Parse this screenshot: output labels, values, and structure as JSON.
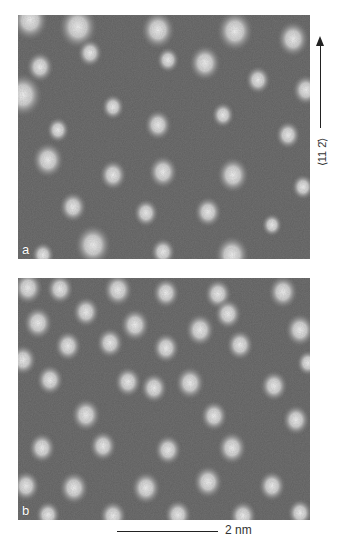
{
  "figure": {
    "panels": [
      {
        "label": "a",
        "description": "HRTEM lattice image with bright atomic columns on dark background",
        "bright_spots": [
          [
            12,
            5,
            16
          ],
          [
            60,
            12,
            17
          ],
          [
            140,
            15,
            15
          ],
          [
            217,
            16,
            16
          ],
          [
            275,
            24,
            14
          ],
          [
            5,
            80,
            17
          ],
          [
            22,
            52,
            12
          ],
          [
            72,
            38,
            11
          ],
          [
            150,
            45,
            10
          ],
          [
            187,
            48,
            14
          ],
          [
            288,
            75,
            12
          ],
          [
            95,
            92,
            10
          ],
          [
            240,
            65,
            11
          ],
          [
            40,
            115,
            10
          ],
          [
            140,
            110,
            12
          ],
          [
            205,
            100,
            10
          ],
          [
            270,
            120,
            11
          ],
          [
            30,
            145,
            14
          ],
          [
            95,
            160,
            12
          ],
          [
            145,
            157,
            13
          ],
          [
            215,
            160,
            14
          ],
          [
            285,
            172,
            10
          ],
          [
            55,
            192,
            12
          ],
          [
            128,
            198,
            11
          ],
          [
            190,
            197,
            12
          ],
          [
            254,
            210,
            9
          ],
          [
            75,
            230,
            16
          ],
          [
            25,
            240,
            10
          ],
          [
            145,
            237,
            11
          ],
          [
            214,
            240,
            15
          ]
        ]
      },
      {
        "label": "b",
        "description": "HRTEM lattice image, regular hexagonal arrangement of bright spots",
        "bright_spots": [
          [
            10,
            10,
            13
          ],
          [
            42,
            11,
            12
          ],
          [
            100,
            12,
            13
          ],
          [
            148,
            15,
            12
          ],
          [
            200,
            16,
            12
          ],
          [
            265,
            14,
            13
          ],
          [
            68,
            34,
            12
          ],
          [
            210,
            36,
            12
          ],
          [
            282,
            52,
            13
          ],
          [
            20,
            45,
            13
          ],
          [
            117,
            47,
            13
          ],
          [
            182,
            52,
            13
          ],
          [
            50,
            68,
            12
          ],
          [
            92,
            65,
            12
          ],
          [
            148,
            70,
            12
          ],
          [
            222,
            67,
            12
          ],
          [
            290,
            85,
            10
          ],
          [
            5,
            82,
            12
          ],
          [
            136,
            110,
            12
          ],
          [
            32,
            102,
            12
          ],
          [
            110,
            104,
            12
          ],
          [
            172,
            105,
            13
          ],
          [
            256,
            108,
            12
          ],
          [
            68,
            137,
            13
          ],
          [
            196,
            138,
            12
          ],
          [
            278,
            142,
            12
          ],
          [
            24,
            170,
            12
          ],
          [
            85,
            168,
            12
          ],
          [
            150,
            172,
            12
          ],
          [
            214,
            170,
            13
          ],
          [
            8,
            208,
            12
          ],
          [
            56,
            210,
            13
          ],
          [
            128,
            210,
            13
          ],
          [
            190,
            204,
            13
          ],
          [
            254,
            208,
            12
          ],
          [
            95,
            238,
            12
          ],
          [
            160,
            237,
            12
          ],
          [
            225,
            238,
            12
          ],
          [
            30,
            237,
            11
          ],
          [
            282,
            235,
            11
          ]
        ]
      }
    ],
    "direction": {
      "label": "⟨11 2̄⟩"
    },
    "scale_bar": {
      "label": "2 nm"
    }
  }
}
